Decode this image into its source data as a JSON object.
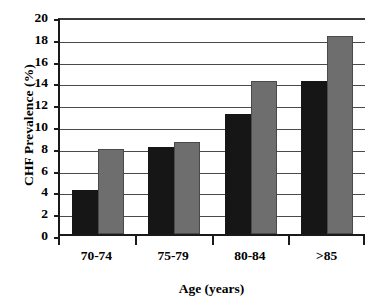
{
  "chart_data": {
    "type": "bar",
    "title": "",
    "xlabel": "Age (years)",
    "ylabel": "CHF Prevalence (%)",
    "categories": [
      "70-74",
      "75-79",
      "80-84",
      ">85"
    ],
    "series": [
      {
        "name": "series-1",
        "color": "#161616",
        "values": [
          4.0,
          8.0,
          11.0,
          14.0
        ]
      },
      {
        "name": "series-2",
        "color": "#6e6e6e",
        "values": [
          7.8,
          8.4,
          14.0,
          18.2
        ]
      }
    ],
    "ylim": [
      0,
      20
    ],
    "yticks": [
      0,
      2,
      4,
      6,
      8,
      10,
      12,
      14,
      16,
      18,
      20
    ],
    "ytick_labels": [
      "0",
      "2",
      "4",
      "6",
      "8",
      "10",
      "12",
      "14",
      "16",
      "18",
      "20"
    ],
    "grid": true,
    "grid_axis": "y",
    "legend": "none",
    "bar_count_per_group": 2
  }
}
